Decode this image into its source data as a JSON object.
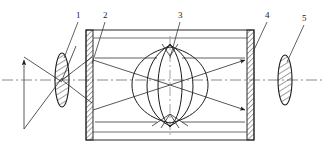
{
  "figure": {
    "title": "",
    "background_color": "#ffffff",
    "line_color": "#1b1b1b",
    "axis_color": "#6b6b6b",
    "hatch_color": "#1b1b1b",
    "width": 324,
    "height": 159
  },
  "labels": [
    {
      "id": "1",
      "text": "1",
      "target": "input-lens"
    },
    {
      "id": "2",
      "text": "2",
      "target": "chamber-left-wall"
    },
    {
      "id": "3",
      "text": "3",
      "target": "central-lens-assembly"
    },
    {
      "id": "4",
      "text": "4",
      "target": "chamber-right-wall"
    },
    {
      "id": "5",
      "text": "5",
      "target": "output-lens"
    }
  ],
  "components": {
    "input_lens": {
      "name": "input-lens",
      "cx": 62,
      "cy": 80,
      "rx": 7,
      "ry": 27,
      "hatched": true
    },
    "output_lens": {
      "name": "output-lens",
      "cx": 285,
      "cy": 80,
      "rx": 7,
      "ry": 25,
      "hatched": true
    },
    "chamber": {
      "name": "chamber",
      "x": 86,
      "y": 30,
      "width": 168,
      "height": 110,
      "wall_thickness": 7
    },
    "central_lens_assembly": {
      "name": "central-lens-assembly",
      "cx": 170,
      "cy": 85,
      "r": 38,
      "element_count": 6
    },
    "optical_axis": {
      "name": "optical-axis",
      "y": 80,
      "x1": 2,
      "x2": 322,
      "style": "dash-dot"
    },
    "vertical_axis": {
      "name": "vertical-center-axis",
      "x": 170,
      "y1": 36,
      "y2": 136,
      "style": "dash-dot"
    },
    "object_plane": {
      "name": "object-plane-arrow",
      "x": 24,
      "y1": 57,
      "y2": 129
    }
  },
  "ray_bundles": {
    "left_cone": {
      "name": "left-ray-cone",
      "apex_x": 62,
      "apex_y": 80
    },
    "chamber_rays": {
      "name": "chamber-ray-cone",
      "focus_x": 170,
      "focus_y": 85
    },
    "aperture_stops": 4
  }
}
